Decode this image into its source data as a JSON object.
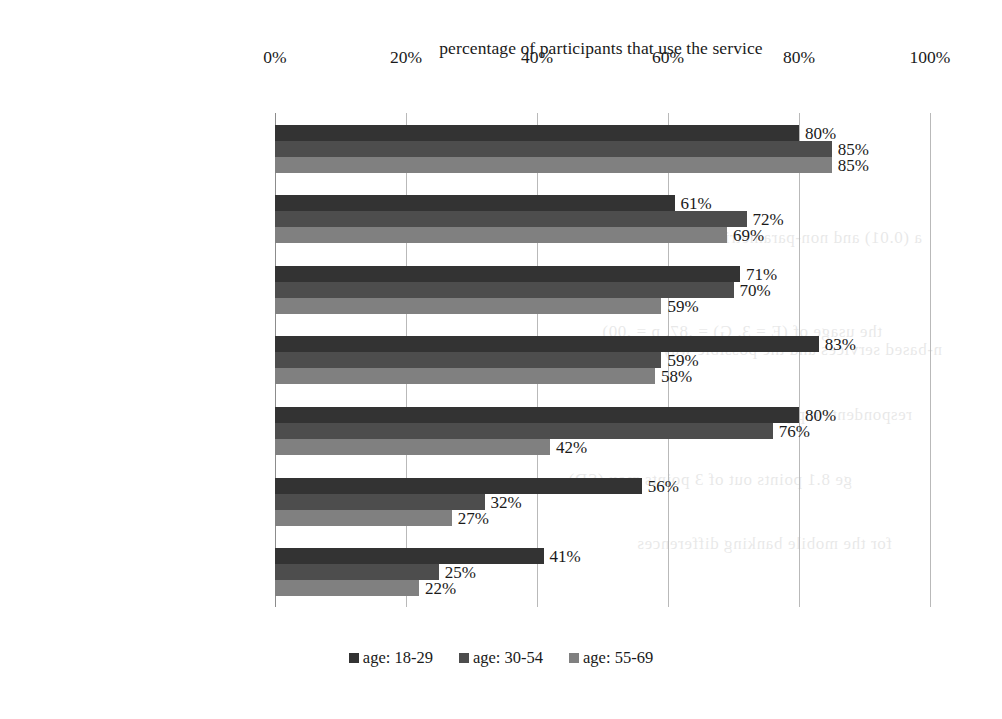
{
  "chart_data": {
    "type": "bar",
    "orientation": "horizontal",
    "title": "percentage of participants that use the service",
    "xlabel": "",
    "ylabel": "",
    "xlim": [
      0,
      100
    ],
    "xticks": [
      "0%",
      "20%",
      "40%",
      "60%",
      "80%",
      "100%"
    ],
    "xtick_values": [
      0,
      20,
      40,
      60,
      80,
      100
    ],
    "grid": true,
    "legend_position": "bottom",
    "value_label_suffix": "%",
    "categories": [
      "e-commerce",
      "online banking",
      "location-based services",
      "social networks",
      "chat",
      "cloud services",
      "videochat"
    ],
    "series": [
      {
        "name": "age: 18-29",
        "color": "#333333",
        "values": [
          80,
          61,
          71,
          83,
          80,
          56,
          41
        ],
        "labels": [
          "80%",
          "61%",
          "71%",
          "83%",
          "80%",
          "56%",
          "41%"
        ]
      },
      {
        "name": "age: 30-54",
        "color": "#4d4d4d",
        "values": [
          85,
          72,
          70,
          59,
          76,
          32,
          25
        ],
        "labels": [
          "85%",
          "72%",
          "70%",
          "59%",
          "76%",
          "32%",
          "25%"
        ]
      },
      {
        "name": "age: 55-69",
        "color": "#808080",
        "values": [
          85,
          69,
          59,
          58,
          42,
          27,
          22
        ],
        "labels": [
          "85%",
          "69%",
          "59%",
          "58%",
          "42%",
          "27%",
          "22%"
        ]
      }
    ]
  },
  "legend": {
    "items": [
      {
        "label": "age: 18-29",
        "color": "#333333"
      },
      {
        "label": "age: 30-54",
        "color": "#4d4d4d"
      },
      {
        "label": "age: 55-69",
        "color": "#808080"
      }
    ]
  },
  "scan_bleed": {
    "lines": [
      "a (0.01) and non-parametric Kruskal",
      "the usage of (E = 3, G) = .87, p = .00)",
      "n-based services and the possible ways",
      "ge 8.1 points out of 3 points max (SD)",
      "respondents reply with one of the",
      "for the mobile banking differences"
    ]
  }
}
